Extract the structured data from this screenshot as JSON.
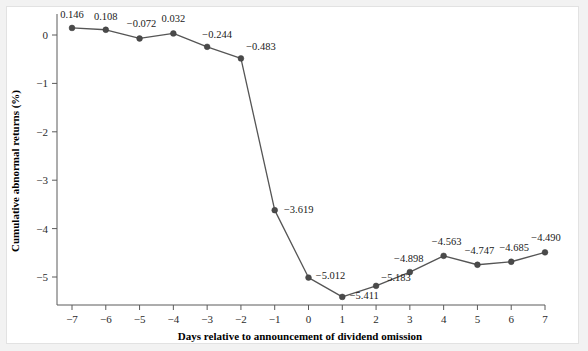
{
  "chart_data": {
    "type": "line",
    "title": "",
    "xlabel": "Days relative to announcement of dividend omission",
    "ylabel": "Cumulative abnormal returns (%)",
    "x": [
      -7,
      -6,
      -5,
      -4,
      -3,
      -2,
      -1,
      0,
      1,
      2,
      3,
      4,
      5,
      6,
      7
    ],
    "values": [
      0.146,
      0.108,
      -0.072,
      0.032,
      -0.244,
      -0.483,
      -3.619,
      -5.012,
      -5.411,
      -5.183,
      -4.898,
      -4.563,
      -4.747,
      -4.685,
      -4.49
    ],
    "point_labels": [
      "0.146",
      "0.108",
      "−0.072",
      "0.032",
      "−0.244",
      "−0.483",
      "−3.619",
      "−5.012",
      "−5.411",
      "−5.183",
      "−4.898",
      "−4.563",
      "−4.747",
      "−4.685",
      "−4.490"
    ],
    "xticks": [
      -7,
      -6,
      -5,
      -4,
      -3,
      -2,
      -1,
      0,
      1,
      2,
      3,
      4,
      5,
      6,
      7
    ],
    "xtick_labels": [
      "−7",
      "−6",
      "−5",
      "−4",
      "−3",
      "−2",
      "−1",
      "0",
      "1",
      "2",
      "3",
      "4",
      "5",
      "6",
      "7"
    ],
    "yticks": [
      0,
      -1,
      -2,
      -3,
      -4,
      -5
    ],
    "ytick_labels": [
      "0",
      "−1",
      "−2",
      "−3",
      "−4",
      "−5"
    ],
    "xlim": [
      -7,
      7
    ],
    "ylim": [
      -5.6,
      0.35
    ],
    "grid": false,
    "legend": null,
    "series_color": "#555555",
    "marker_color": "#4a4a4a",
    "axis_color": "#5a5a5a",
    "background_color": "#ffffff",
    "page_background_color": "#f2f2f2"
  }
}
